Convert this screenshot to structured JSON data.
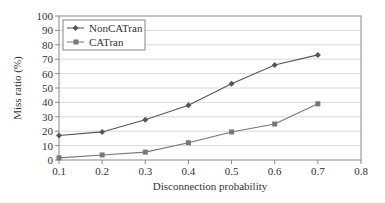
{
  "chart_data": {
    "type": "line",
    "title": "",
    "xlabel": "Disconnection probability",
    "ylabel": "Miss ratio (%)",
    "x": [
      0.1,
      0.2,
      0.3,
      0.4,
      0.5,
      0.6,
      0.7
    ],
    "xticks": [
      "0.1",
      "0.2",
      "0.3",
      "0.4",
      "0.5",
      "0.6",
      "0.7",
      "0.8"
    ],
    "yticks": [
      "0",
      "10",
      "20",
      "30",
      "40",
      "50",
      "60",
      "70",
      "80",
      "90",
      "100"
    ],
    "xlim": [
      0.1,
      0.8
    ],
    "ylim": [
      0,
      100
    ],
    "grid": true,
    "legend_position": "upper left",
    "series": [
      {
        "name": "NonCATran",
        "marker": "diamond",
        "color": "#555555",
        "values": [
          17,
          19.5,
          28,
          38,
          53,
          66,
          73
        ]
      },
      {
        "name": "CATran",
        "marker": "square",
        "color": "#777777",
        "values": [
          1.5,
          3.5,
          5.5,
          12,
          19.5,
          25,
          39
        ]
      }
    ]
  }
}
